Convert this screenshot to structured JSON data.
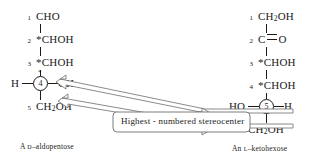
{
  "figure": {
    "background": "#ffffff",
    "line_color": "#1a1a1a",
    "callout_label": "Highest - numbered stereocenter"
  },
  "left_structure": {
    "caption_prefix": "A ",
    "caption_config": "D",
    "caption_suffix": "–aldopentose",
    "rows": [
      {
        "number": "1",
        "group": "CHO"
      },
      {
        "number": "2",
        "group": "*CHOH"
      },
      {
        "number": "3",
        "group": "*CHOH"
      },
      {
        "number": "4",
        "group": ""
      },
      {
        "number": "5",
        "group": "CH",
        "sub": "2",
        "group_tail": "OH"
      }
    ],
    "stereocenter": {
      "number": "4",
      "star": "*",
      "left_substituent": "H",
      "right_substituent": "OH"
    }
  },
  "right_structure": {
    "caption_prefix": "An ",
    "caption_config": "L",
    "caption_suffix": "–ketohexose",
    "rows": [
      {
        "number": "1",
        "group": "CH",
        "sub": "2",
        "group_tail": "OH"
      },
      {
        "number": "2",
        "group": "C",
        "bond": "double",
        "group_tail": "O"
      },
      {
        "number": "3",
        "group": "*CHOH"
      },
      {
        "number": "4",
        "group": "*CHOH"
      },
      {
        "number": "5",
        "group": ""
      },
      {
        "number": "6",
        "group": "CH",
        "sub": "2",
        "group_tail": "OH"
      }
    ],
    "stereocenter": {
      "number": "5",
      "left_substituent": "HO",
      "right_substituent": "H"
    }
  }
}
